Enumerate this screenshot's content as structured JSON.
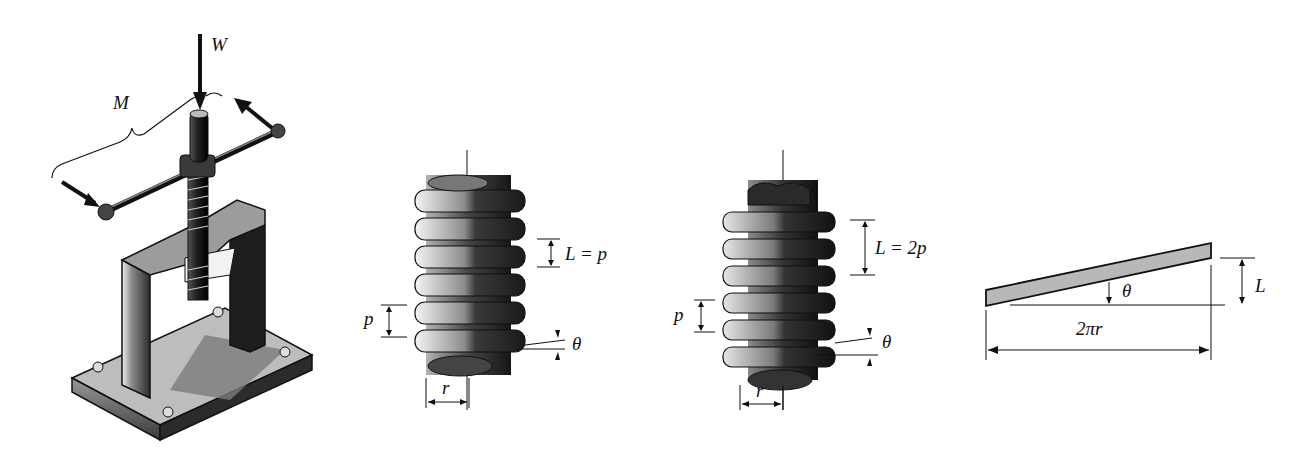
{
  "figure": {
    "panels": [
      {
        "id": "screw-jack",
        "labels": {
          "load": "W",
          "moment": "M"
        }
      },
      {
        "id": "single-thread-screw",
        "labels": {
          "lead": "L = p",
          "pitch": "p",
          "angle": "θ",
          "radius": "r"
        }
      },
      {
        "id": "double-thread-screw",
        "labels": {
          "lead": "L = 2p",
          "pitch": "p",
          "angle": "θ",
          "radius": "r"
        }
      },
      {
        "id": "unwrapped-thread-incline",
        "labels": {
          "angle": "θ",
          "rise": "L",
          "circumference": "2πr"
        }
      }
    ],
    "colors": {
      "ink": "#111111",
      "metal_dark": "#2a2a2a",
      "metal_mid": "#6e6e6e",
      "metal_light": "#d8d8d8",
      "incline_fill": "#b8b8b8"
    }
  }
}
